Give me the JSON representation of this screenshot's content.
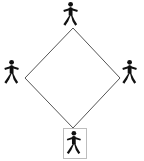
{
  "canvas": {
    "width": 144,
    "height": 161,
    "background": "#ffffff"
  },
  "diagram": {
    "shape_name": "diamond",
    "shape": {
      "stroke": "#555555",
      "stroke_width": 1,
      "fill": "none",
      "points": "73,28 120,78 73,128 25,78"
    },
    "figures": [
      {
        "id": "top",
        "label": "pedestrian-top",
        "position": "top",
        "x": 73,
        "y": 15,
        "selected": false,
        "color": "#111111"
      },
      {
        "id": "left",
        "label": "pedestrian-left",
        "position": "left",
        "x": 14,
        "y": 73,
        "selected": false,
        "color": "#111111"
      },
      {
        "id": "right",
        "label": "pedestrian-right",
        "position": "right",
        "x": 132,
        "y": 73,
        "selected": false,
        "color": "#111111"
      },
      {
        "id": "bottom",
        "label": "pedestrian-bottom",
        "position": "bottom",
        "x": 74,
        "y": 143,
        "selected": true,
        "color": "#111111"
      }
    ],
    "selection_box": {
      "x": 63,
      "y": 128,
      "width": 23,
      "height": 30,
      "stroke": "#bdbdbd",
      "stroke_width": 1,
      "fill": "#ffffff"
    }
  }
}
